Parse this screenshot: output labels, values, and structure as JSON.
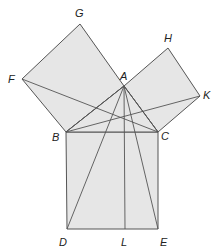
{
  "diagram": {
    "fill_color": "#e6e6e6",
    "stroke_color": "#555555",
    "points": {
      "A": {
        "x": 124,
        "y": 86,
        "lx": 120,
        "ly": 80
      },
      "B": {
        "x": 66,
        "y": 132,
        "lx": 52,
        "ly": 141
      },
      "C": {
        "x": 158,
        "y": 132,
        "lx": 161,
        "ly": 140
      },
      "D": {
        "x": 67,
        "y": 229,
        "lx": 59,
        "ly": 246
      },
      "E": {
        "x": 158,
        "y": 229,
        "lx": 160,
        "ly": 246
      },
      "L": {
        "x": 125,
        "y": 229,
        "lx": 121,
        "ly": 246
      },
      "F": {
        "x": 22,
        "y": 79,
        "lx": 8,
        "ly": 83
      },
      "G": {
        "x": 80,
        "y": 24,
        "lx": 75,
        "ly": 17
      },
      "H": {
        "x": 168,
        "y": 48,
        "lx": 164,
        "ly": 42
      },
      "K": {
        "x": 200,
        "y": 96,
        "lx": 203,
        "ly": 99
      }
    },
    "labels": [
      "A",
      "B",
      "C",
      "D",
      "E",
      "L",
      "F",
      "G",
      "H",
      "K"
    ]
  }
}
